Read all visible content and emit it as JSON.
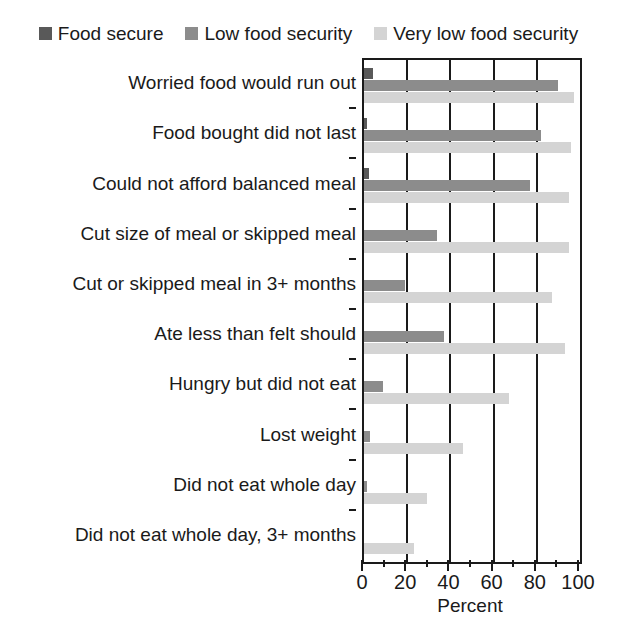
{
  "legend": {
    "items": [
      {
        "label": "Food secure",
        "color": "#595959",
        "key": "food_secure"
      },
      {
        "label": "Low food security",
        "color": "#8c8c8c",
        "key": "low_food_security"
      },
      {
        "label": "Very low food security",
        "color": "#d4d4d4",
        "key": "very_low_food_security"
      }
    ]
  },
  "axis": {
    "xlabel": "Percent",
    "tick_labels": [
      "0",
      "20",
      "40",
      "60",
      "80",
      "100"
    ],
    "tick_values": [
      0,
      20,
      40,
      60,
      80,
      100
    ],
    "minor_tick_values": [
      10,
      30,
      50,
      70,
      90
    ]
  },
  "chart_data": {
    "type": "bar",
    "orientation": "horizontal",
    "title": "",
    "xlabel": "Percent",
    "ylabel": "",
    "xlim": [
      0,
      100
    ],
    "grid": true,
    "legend_position": "top",
    "categories": [
      "Worried food would run out",
      "Food bought did not last",
      "Could not afford balanced meal",
      "Cut size of meal or skipped meal",
      "Cut or skipped meal in 3+ months",
      "Ate less than felt should",
      "Hungry but did not eat",
      "Lost weight",
      "Did not eat whole day",
      "Did not eat whole day, 3+ months"
    ],
    "series": [
      {
        "name": "Food secure",
        "color": "#595959",
        "values": [
          4,
          1.5,
          2.5,
          0,
          0,
          0,
          0,
          0,
          0,
          0
        ]
      },
      {
        "name": "Low food security",
        "color": "#8c8c8c",
        "values": [
          90,
          82,
          77,
          34,
          19,
          37,
          9,
          3,
          1.5,
          0
        ]
      },
      {
        "name": "Very low food security",
        "color": "#d4d4d4",
        "values": [
          97,
          96,
          95,
          95,
          87,
          93,
          67,
          46,
          29,
          23
        ]
      }
    ]
  }
}
